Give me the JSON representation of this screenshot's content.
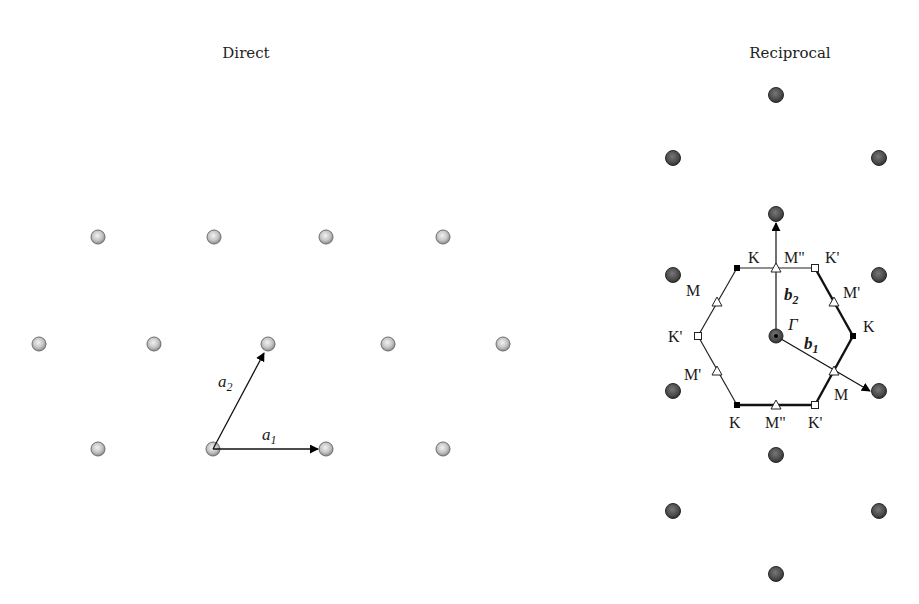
{
  "panels": {
    "direct": {
      "title": "Direct",
      "atom_fill": "#c8c8c8",
      "atoms": [
        {
          "x": 98,
          "y": 237
        },
        {
          "x": 214,
          "y": 237
        },
        {
          "x": 326,
          "y": 237
        },
        {
          "x": 443,
          "y": 237
        },
        {
          "x": 39,
          "y": 344
        },
        {
          "x": 154,
          "y": 344
        },
        {
          "x": 268,
          "y": 344
        },
        {
          "x": 388,
          "y": 344
        },
        {
          "x": 503,
          "y": 344
        },
        {
          "x": 98,
          "y": 449
        },
        {
          "x": 213,
          "y": 449
        },
        {
          "x": 326,
          "y": 449
        },
        {
          "x": 443,
          "y": 449
        }
      ],
      "vectors": {
        "a1": {
          "label": "a",
          "sub": "1"
        },
        "a2": {
          "label": "a",
          "sub": "2"
        }
      }
    },
    "reciprocal": {
      "title": "Reciprocal",
      "point_fill": "#555555",
      "points": [
        {
          "x": 776,
          "y": 95
        },
        {
          "x": 673,
          "y": 158
        },
        {
          "x": 879,
          "y": 158
        },
        {
          "x": 776,
          "y": 214
        },
        {
          "x": 673,
          "y": 275
        },
        {
          "x": 879,
          "y": 275
        },
        {
          "x": 673,
          "y": 391
        },
        {
          "x": 879,
          "y": 391
        },
        {
          "x": 776,
          "y": 455
        },
        {
          "x": 673,
          "y": 511
        },
        {
          "x": 879,
          "y": 511
        },
        {
          "x": 776,
          "y": 574
        }
      ],
      "center_label": "Γ",
      "vectors": {
        "b1": {
          "label": "b",
          "sub": "1"
        },
        "b2": {
          "label": "b",
          "sub": "2"
        }
      },
      "bz_labels": {
        "top_k": "K",
        "top_m2": "M\"",
        "top_k1": "K'",
        "upper_left_m": "M",
        "upper_right_m1": "M'",
        "left_k1": "K'",
        "right_k": "K",
        "lower_left_m1": "M'",
        "lower_right_m": "M",
        "bottom_k": "K",
        "bottom_m2": "M\"",
        "bottom_k1": "K'"
      }
    }
  }
}
